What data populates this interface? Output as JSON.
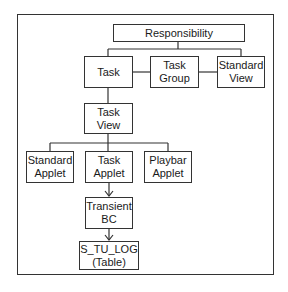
{
  "diagram": {
    "type": "hierarchy",
    "nodes": {
      "responsibility": "Responsibility",
      "task": "Task",
      "task_group": "Task\nGroup",
      "standard_view": "Standard\nView",
      "task_view": "Task View",
      "standard_applet": "Standard\nApplet",
      "task_applet": "Task\nApplet",
      "playbar_applet": "Playbar\nApplet",
      "transient_bc": "Transient\nBC",
      "s_tu_log": "S_TU_LOG\n(Table)"
    },
    "edges": [
      {
        "from": "Responsibility",
        "to": "Task"
      },
      {
        "from": "Responsibility",
        "to": "Standard View"
      },
      {
        "from": "Task",
        "to": "Task Group"
      },
      {
        "from": "Task Group",
        "to": "Standard View"
      },
      {
        "from": "Task",
        "to": "Task View"
      },
      {
        "from": "Task View",
        "to": "Standard Applet"
      },
      {
        "from": "Task View",
        "to": "Task Applet"
      },
      {
        "from": "Task View",
        "to": "Playbar Applet"
      },
      {
        "from": "Task Applet",
        "to": "Transient BC",
        "arrow": true
      },
      {
        "from": "Transient BC",
        "to": "S_TU_LOG (Table)",
        "arrow": true
      }
    ]
  }
}
